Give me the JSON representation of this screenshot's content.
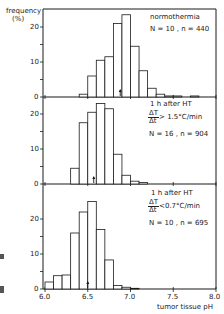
{
  "chart_data": [
    {
      "type": "bar",
      "panel": "top",
      "title": "normothermia",
      "annotation": "N = 10 , n = 440",
      "xlabel": "tumor tissue pH",
      "ylabel": "frequency (%)",
      "bin_width": 0.1,
      "bins_start": [
        6.4,
        6.5,
        6.6,
        6.7,
        6.8,
        6.9,
        7.0,
        7.1,
        7.2,
        7.3,
        7.4,
        7.5,
        7.7
      ],
      "values": [
        0.8,
        6.0,
        10.5,
        11.5,
        21.0,
        23.5,
        14.5,
        7.5,
        2.5,
        0.8,
        0.3,
        0.3,
        0.3
      ],
      "median_marker": 6.88,
      "xlim": [
        6.0,
        8.0
      ],
      "ylim": [
        0,
        25
      ]
    },
    {
      "type": "bar",
      "panel": "middle",
      "title": "1 h after HT",
      "condition": "ΔT/Δt > 1.5°C/min",
      "annotation": "N = 16 , n = 904",
      "xlabel": "tumor tissue pH",
      "ylabel": "frequency (%)",
      "bin_width": 0.1,
      "bins_start": [
        6.3,
        6.4,
        6.5,
        6.6,
        6.7,
        6.8,
        6.9,
        7.0,
        7.1
      ],
      "values": [
        4.5,
        17.5,
        20.5,
        23.0,
        21.5,
        8.5,
        2.5,
        0.8,
        0.4
      ],
      "median_marker": 6.57,
      "xlim": [
        6.0,
        8.0
      ],
      "ylim": [
        0,
        25
      ]
    },
    {
      "type": "bar",
      "panel": "bottom",
      "title": "1 h after HT",
      "condition": "ΔT/Δt < 0.7°C/min",
      "annotation": "N = 10 , n = 695",
      "xlabel": "tumor tissue pH",
      "ylabel": "frequency (%)",
      "bin_width": 0.1,
      "bins_start": [
        6.0,
        6.1,
        6.2,
        6.3,
        6.4,
        6.5,
        6.6,
        6.7,
        6.8,
        6.9,
        7.0
      ],
      "values": [
        2.0,
        3.8,
        4.0,
        16.0,
        22.0,
        25.0,
        17.0,
        8.3,
        1.0,
        0.5,
        0.2
      ],
      "median_marker": 6.5,
      "xlim": [
        6.0,
        8.0
      ],
      "ylim": [
        0,
        25
      ]
    }
  ],
  "axes": {
    "ylabel_line1": "frequency",
    "ylabel_line2": "(%)",
    "yticks": [
      "0",
      "10",
      "20"
    ],
    "xticks": [
      "6.0",
      "6.5",
      "7.0",
      "7.5",
      "8.0"
    ],
    "xlabel": "tumor tissue pH"
  },
  "panels": [
    {
      "line1": "normothermia",
      "line2": "N = 10 , n = 440"
    },
    {
      "line1": "1 h  after HT",
      "num": "ΔT",
      "den": "Δt",
      "cond": "> 1.5°C/min",
      "line4": "N = 16 , n = 904"
    },
    {
      "line1": "1 h  after HT",
      "num": "ΔT",
      "den": "Δt",
      "cond": "<0.7°C/min",
      "line4": "N = 10 , n = 695"
    }
  ]
}
